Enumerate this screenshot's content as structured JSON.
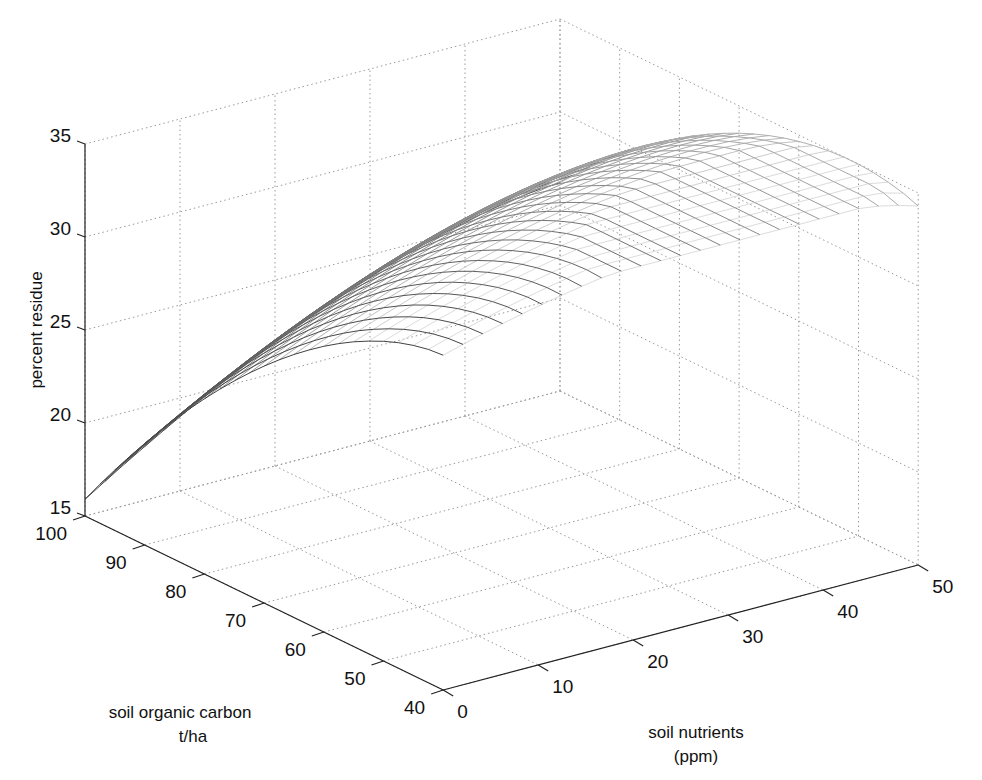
{
  "chart_data": {
    "type": "surface",
    "title": "",
    "xlabel": "soil nutrients\n(ppm)",
    "ylabel": "soil organic carbon\nt/ha",
    "zlabel": "percent residue",
    "xlabel_lines": [
      "soil nutrients",
      "(ppm)"
    ],
    "ylabel_lines": [
      "soil organic carbon",
      "t/ha"
    ],
    "x_ticks": [
      0,
      10,
      20,
      30,
      40,
      50
    ],
    "y_ticks": [
      40,
      50,
      60,
      70,
      80,
      90,
      100
    ],
    "z_ticks": [
      15,
      20,
      25,
      30,
      35
    ],
    "xlim": [
      0,
      50
    ],
    "ylim": [
      40,
      100
    ],
    "zlim": [
      15,
      35
    ],
    "grid": true,
    "render": "wireframe mesh",
    "x": [
      0,
      2.08,
      4.17,
      6.25,
      8.33,
      10.42,
      12.5,
      14.58,
      16.67,
      18.75,
      20.83,
      22.92,
      25,
      27.08,
      29.17,
      31.25,
      33.33,
      35.42,
      37.5,
      39.58,
      41.67,
      43.75,
      45.83,
      47.92,
      50
    ],
    "y": [
      100,
      97.5,
      95,
      92.5,
      90,
      87.5,
      85,
      82.5,
      80,
      77.5,
      75,
      72.5,
      70,
      67.5,
      65,
      62.5,
      60,
      57.5,
      55,
      52.5,
      50,
      47.5,
      45,
      42.5,
      40
    ],
    "z_description": "percent residue rises from ~15.9 at (0 ppm, 100 t/ha) to ~26 at (50 ppm, 100 t/ha) and ~33 at (0 ppm, 40 t/ha); concave surface with a saddle near the 50 ppm / 100 t/ha edge",
    "corner_values": {
      "n0_soc100": 15.9,
      "n50_soc100": 26.2,
      "n0_soc40": 33.0,
      "n50_soc40": 34.0
    }
  }
}
